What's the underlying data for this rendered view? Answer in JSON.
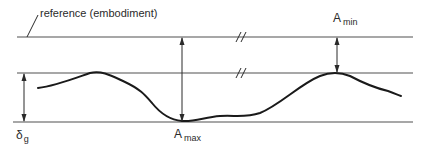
{
  "diagram": {
    "type": "surface-profile-tolerance",
    "colors": {
      "reference_lines": "#8a8a8a",
      "curve": "#1a1a1a",
      "arrows": "#2a2a2a",
      "text": "#2a2a2a",
      "background": "#ffffff"
    },
    "labels": {
      "reference": "reference (embodiment)",
      "a_min": {
        "main": "A",
        "sub": "min"
      },
      "a_max": {
        "main": "A",
        "sub": "max"
      },
      "delta_g": {
        "main": "δ",
        "sub": "g"
      }
    },
    "lines": [
      {
        "name": "reference-line",
        "y": 37,
        "x1": 17,
        "x2": 413
      },
      {
        "name": "upper-envelope-line",
        "y": 73,
        "x1": 17,
        "x2": 413
      },
      {
        "name": "lower-envelope-line",
        "y": 122,
        "x1": 13,
        "x2": 413
      }
    ],
    "break_marks": [
      {
        "on": "reference-line",
        "x": 240,
        "symbol": "//"
      },
      {
        "on": "upper-envelope-line",
        "x": 240,
        "symbol": "//"
      }
    ],
    "dimensions": [
      {
        "name": "delta-g-dimension",
        "x": 24,
        "y1": 73,
        "y2": 122
      },
      {
        "name": "a-max-dimension",
        "x": 182,
        "y1": 37,
        "y2": 122
      },
      {
        "name": "a-min-dimension",
        "x": 337,
        "y1": 37,
        "y2": 73
      }
    ]
  }
}
